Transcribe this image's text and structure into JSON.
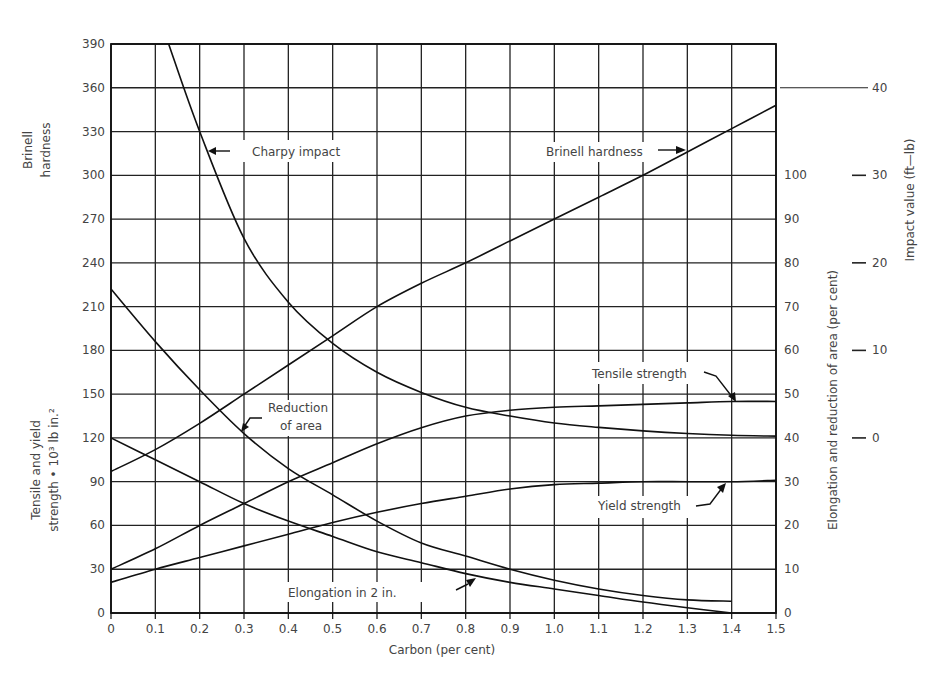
{
  "chart_data": {
    "type": "line",
    "title": "",
    "xlabel": "Carbon (per cent)",
    "x": [
      0,
      0.1,
      0.2,
      0.3,
      0.4,
      0.5,
      0.6,
      0.7,
      0.8,
      0.9,
      1.0,
      1.1,
      1.2,
      1.3,
      1.4,
      1.5
    ],
    "x_ticks": [
      "0",
      "0.1",
      "0.2",
      "0.3",
      "0.4",
      "0.5",
      "0.6",
      "0.7",
      "0.8",
      "0.9",
      "1.0",
      "1.1",
      "1.2",
      "1.3",
      "1.4",
      "1.5"
    ],
    "xlim": [
      0,
      1.5
    ],
    "grid": true,
    "axes": {
      "left_upper_label": "Brinell hardness",
      "left_lower_label": "Tensile and yield strength • 10³ lb in.²",
      "left_ticks": [
        "0",
        "30",
        "60",
        "90",
        "120",
        "150",
        "180",
        "210",
        "240",
        "270",
        "300",
        "330",
        "360",
        "390"
      ],
      "left_ylim": [
        0,
        390
      ],
      "right_label": "Elongation and reduction of area (per cent)",
      "right_ticks": [
        "0",
        "10",
        "20",
        "30",
        "40",
        "50",
        "60",
        "70",
        "80",
        "90",
        "100"
      ],
      "right_ylim": [
        0,
        130
      ],
      "impact_label": "Impact value (ft—lb)",
      "impact_ticks": [
        "0",
        "10",
        "20",
        "30",
        "40"
      ],
      "impact_note": "Impact scale: 0 ft-lb aligns with 120 on left scale; 10 ft-lb = 60 left-scale units"
    },
    "series": [
      {
        "name": "Brinell hardness",
        "axis": "left",
        "unit": "BHN",
        "x": [
          0,
          0.1,
          0.2,
          0.3,
          0.4,
          0.5,
          0.6,
          0.7,
          0.8,
          0.9,
          1.0,
          1.1,
          1.2,
          1.3,
          1.4,
          1.5
        ],
        "values": [
          97,
          112,
          130,
          150,
          170,
          190,
          210,
          226,
          240,
          255,
          270,
          285,
          300,
          316,
          332,
          348
        ]
      },
      {
        "name": "Charpy impact",
        "axis": "impact",
        "unit": "ft-lb",
        "x": [
          0.13,
          0.2,
          0.3,
          0.4,
          0.5,
          0.6,
          0.7,
          0.8,
          0.9,
          1.0,
          1.1,
          1.2,
          1.3,
          1.4,
          1.5
        ],
        "values": [
          45,
          35,
          22.8,
          15.5,
          10.8,
          7.5,
          5.2,
          3.5,
          2.5,
          1.7,
          1.2,
          0.8,
          0.5,
          0.3,
          0.2
        ]
      },
      {
        "name": "Reduction of area",
        "axis": "right",
        "unit": "%",
        "x": [
          0,
          0.1,
          0.2,
          0.3,
          0.4,
          0.5,
          0.6,
          0.7,
          0.8,
          0.9,
          1.0,
          1.1,
          1.2,
          1.3,
          1.4
        ],
        "values": [
          74,
          62,
          51,
          41,
          33,
          27,
          21,
          16,
          13,
          10,
          7.5,
          5.5,
          4,
          3,
          2.7
        ]
      },
      {
        "name": "Elongation in 2 in.",
        "axis": "right",
        "unit": "%",
        "x": [
          0,
          0.1,
          0.2,
          0.3,
          0.4,
          0.5,
          0.6,
          0.7,
          0.8,
          0.9,
          1.0,
          1.1,
          1.2,
          1.3,
          1.4
        ],
        "values": [
          40,
          35,
          30,
          25,
          21,
          17.5,
          14,
          11.5,
          9,
          7,
          5.5,
          4,
          2.5,
          1.2,
          0
        ]
      },
      {
        "name": "Tensile strength",
        "axis": "left",
        "unit": "10³ lb/in²",
        "x": [
          0,
          0.1,
          0.2,
          0.3,
          0.4,
          0.5,
          0.6,
          0.7,
          0.8,
          0.9,
          1.0,
          1.1,
          1.2,
          1.3,
          1.4,
          1.5
        ],
        "values": [
          30,
          44,
          60,
          75,
          90,
          103,
          116,
          127,
          135,
          139,
          141,
          142,
          143,
          144,
          145,
          145
        ]
      },
      {
        "name": "Yield strength",
        "axis": "left",
        "unit": "10³ lb/in²",
        "x": [
          0,
          0.1,
          0.2,
          0.3,
          0.4,
          0.5,
          0.6,
          0.7,
          0.8,
          0.9,
          1.0,
          1.1,
          1.2,
          1.3,
          1.4,
          1.5
        ],
        "values": [
          21,
          30,
          38,
          46,
          54,
          62,
          69,
          75,
          80,
          85,
          88,
          89,
          90,
          90,
          90,
          91
        ]
      }
    ],
    "annotations": [
      "Charpy impact",
      "Brinell hardness",
      "Reduction of area",
      "Tensile strength",
      "Yield strength",
      "Elongation in 2 in."
    ],
    "legend": "none (inline labels with arrows)"
  },
  "labels": {
    "x_axis": "Carbon (per cent)",
    "brinell_1": "Brinell",
    "brinell_2": "hardness",
    "tensile_1": "Tensile and yield",
    "tensile_2": "strength • 10³ lb in.²",
    "right_axis": "Elongation and reduction of area (per cent)",
    "impact_axis": "Impact value (ft—lb)",
    "charpy": "Charpy impact",
    "brinell_curve": "Brinell hardness",
    "reduction_1": "Reduction",
    "reduction_2": "of area",
    "tensile_curve": "Tensile strength",
    "yield_curve": "Yield strength",
    "elongation_curve": "Elongation in 2 in."
  }
}
